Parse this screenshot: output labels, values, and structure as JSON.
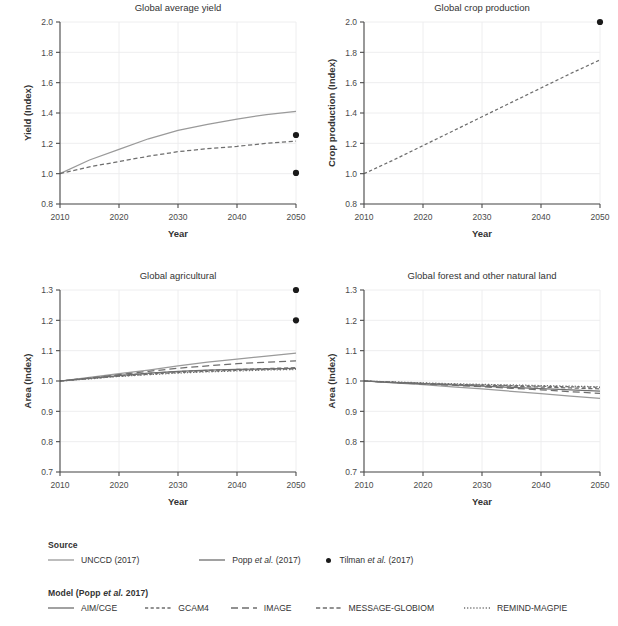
{
  "figure": {
    "width": 618,
    "height": 626,
    "background": "#ffffff",
    "text_color": "#333333"
  },
  "colors": {
    "unccd": "#9a9a9a",
    "popp": "#6e6e6e",
    "tilman": "#1a1a1a",
    "grid": "#ececed",
    "axis": "#4b4b4b"
  },
  "chart_data": [
    {
      "type": "line",
      "id": "global-average-yield",
      "title": "Global average yield",
      "xlabel": "Year",
      "ylabel": "Yield (Index)",
      "xlim": [
        2010,
        2050
      ],
      "ylim": [
        0.8,
        2.0
      ],
      "xticks": [
        2010,
        2020,
        2030,
        2040,
        2050
      ],
      "yticks": [
        0.8,
        1.0,
        1.2,
        1.4,
        1.6,
        1.8,
        2.0
      ],
      "ytick_labels": [
        "0.8",
        "1.0",
        "1.2",
        "1.4",
        "1.6",
        "1.8",
        "2.0"
      ],
      "grid": true,
      "x": [
        2010,
        2015,
        2020,
        2025,
        2030,
        2035,
        2040,
        2045,
        2050
      ],
      "series": [
        {
          "name": "UNCCD (2017)",
          "source": "unccd",
          "style": "solid",
          "values": [
            1.0,
            1.09,
            1.16,
            1.23,
            1.285,
            1.325,
            1.36,
            1.39,
            1.41
          ]
        },
        {
          "name": "Popp et al. (2017)",
          "source": "popp",
          "style": "dashed",
          "values": [
            1.0,
            1.045,
            1.08,
            1.115,
            1.145,
            1.165,
            1.18,
            1.2,
            1.215
          ]
        }
      ],
      "points": [
        {
          "name": "Tilman et al. (2017)",
          "x": 2050,
          "y": 1.255
        },
        {
          "name": "Tilman et al. (2017)",
          "x": 2050,
          "y": 1.005
        }
      ]
    },
    {
      "type": "line",
      "id": "global-crop-production",
      "title": "Global crop production",
      "xlabel": "Year",
      "ylabel": "Crop production (Index)",
      "xlim": [
        2010,
        2050
      ],
      "ylim": [
        0.8,
        2.0
      ],
      "xticks": [
        2010,
        2020,
        2030,
        2040,
        2050
      ],
      "yticks": [
        0.8,
        1.0,
        1.2,
        1.4,
        1.6,
        1.8,
        2.0
      ],
      "ytick_labels": [
        "0.8",
        "1.0",
        "1.2",
        "1.4",
        "1.6",
        "1.8",
        "2.0"
      ],
      "grid": true,
      "x": [
        2010,
        2015,
        2020,
        2025,
        2030,
        2035,
        2040,
        2045,
        2050
      ],
      "series": [
        {
          "name": "Popp et al. (2017)",
          "source": "popp",
          "style": "dotted",
          "values": [
            1.0,
            1.09,
            1.185,
            1.28,
            1.375,
            1.47,
            1.565,
            1.66,
            1.75
          ]
        }
      ],
      "points": [
        {
          "name": "Tilman et al. (2017)",
          "x": 2050,
          "y": 2.0
        }
      ]
    },
    {
      "type": "line",
      "id": "global-agricultural",
      "title": "Global agricultural",
      "xlabel": "Year",
      "ylabel": "Area (Index)",
      "xlim": [
        2010,
        2050
      ],
      "ylim": [
        0.7,
        1.3
      ],
      "xticks": [
        2010,
        2020,
        2030,
        2040,
        2050
      ],
      "yticks": [
        0.7,
        0.8,
        0.9,
        1.0,
        1.1,
        1.2,
        1.3
      ],
      "ytick_labels": [
        "0.7",
        "0.8",
        "0.9",
        "1.0",
        "1.1",
        "1.2",
        "1.3"
      ],
      "grid": true,
      "x": [
        2010,
        2015,
        2020,
        2025,
        2030,
        2035,
        2040,
        2045,
        2050
      ],
      "series": [
        {
          "name": "UNCCD (2017)",
          "source": "unccd",
          "style": "solid",
          "values": [
            1.0,
            1.012,
            1.024,
            1.036,
            1.05,
            1.062,
            1.072,
            1.082,
            1.092
          ]
        },
        {
          "name": "AIM/CGE",
          "source": "popp",
          "style": "solid",
          "values": [
            1.0,
            1.009,
            1.018,
            1.026,
            1.032,
            1.036,
            1.038,
            1.04,
            1.042
          ]
        },
        {
          "name": "GCAM4",
          "source": "popp",
          "style": "dotted",
          "values": [
            1.0,
            1.008,
            1.016,
            1.022,
            1.028,
            1.032,
            1.035,
            1.038,
            1.04
          ]
        },
        {
          "name": "IMAGE",
          "source": "popp",
          "style": "longdash",
          "values": [
            1.0,
            1.01,
            1.021,
            1.032,
            1.042,
            1.05,
            1.057,
            1.062,
            1.066
          ]
        },
        {
          "name": "MESSAGE-GLOBIOM",
          "source": "popp",
          "style": "dashed",
          "values": [
            1.0,
            1.009,
            1.018,
            1.025,
            1.031,
            1.035,
            1.038,
            1.041,
            1.044
          ]
        },
        {
          "name": "REMIND-MAGPIE",
          "source": "popp",
          "style": "finedot",
          "values": [
            1.0,
            1.007,
            1.015,
            1.021,
            1.026,
            1.03,
            1.033,
            1.036,
            1.038
          ]
        }
      ],
      "points": [
        {
          "name": "Tilman et al. (2017)",
          "x": 2050,
          "y": 1.3
        },
        {
          "name": "Tilman et al. (2017)",
          "x": 2050,
          "y": 1.2
        }
      ]
    },
    {
      "type": "line",
      "id": "global-forest-and-other-natural-land",
      "title": "Global forest and other natural land",
      "xlabel": "Year",
      "ylabel": "Area (Index)",
      "xlim": [
        2010,
        2050
      ],
      "ylim": [
        0.7,
        1.3
      ],
      "xticks": [
        2010,
        2020,
        2030,
        2040,
        2050
      ],
      "yticks": [
        0.7,
        0.8,
        0.9,
        1.0,
        1.1,
        1.2,
        1.3
      ],
      "ytick_labels": [
        "0.7",
        "0.8",
        "0.9",
        "1.0",
        "1.1",
        "1.2",
        "1.3"
      ],
      "grid": true,
      "x": [
        2010,
        2015,
        2020,
        2025,
        2030,
        2035,
        2040,
        2045,
        2050
      ],
      "series": [
        {
          "name": "UNCCD (2017)",
          "source": "unccd",
          "style": "solid",
          "values": [
            1.0,
            0.994,
            0.988,
            0.981,
            0.974,
            0.966,
            0.958,
            0.95,
            0.943
          ]
        },
        {
          "name": "AIM/CGE",
          "source": "popp",
          "style": "solid",
          "values": [
            1.0,
            0.995,
            0.991,
            0.987,
            0.983,
            0.979,
            0.975,
            0.971,
            0.967
          ]
        },
        {
          "name": "GCAM4",
          "source": "popp",
          "style": "dotted",
          "values": [
            1.0,
            0.996,
            0.992,
            0.989,
            0.987,
            0.985,
            0.983,
            0.981,
            0.979
          ]
        },
        {
          "name": "IMAGE",
          "source": "popp",
          "style": "longdash",
          "values": [
            1.0,
            0.995,
            0.99,
            0.986,
            0.981,
            0.976,
            0.971,
            0.965,
            0.959
          ]
        },
        {
          "name": "MESSAGE-GLOBIOM",
          "source": "popp",
          "style": "dashed",
          "values": [
            1.0,
            0.996,
            0.992,
            0.989,
            0.986,
            0.983,
            0.98,
            0.977,
            0.974
          ]
        },
        {
          "name": "REMIND-MAGPIE",
          "source": "popp",
          "style": "finedot",
          "values": [
            1.0,
            0.997,
            0.994,
            0.991,
            0.989,
            0.987,
            0.985,
            0.983,
            0.981
          ]
        }
      ],
      "points": []
    }
  ],
  "legend": {
    "source": {
      "heading": "Source",
      "items": [
        {
          "label": "UNCCD (2017)",
          "marker": "line",
          "style": "solid",
          "color": "#9a9a9a",
          "icon": "solid-line-icon"
        },
        {
          "label": "Popp et al. (2017)",
          "marker": "line",
          "style": "solid",
          "color": "#6e6e6e",
          "icon": "solid-line-icon"
        },
        {
          "label": "Tilman et al. (2017)",
          "marker": "dot",
          "style": "dot",
          "color": "#1a1a1a",
          "icon": "filled-circle-icon"
        }
      ]
    },
    "model": {
      "heading": "Model (Popp et al. 2017)",
      "items": [
        {
          "label": "AIM/CGE",
          "marker": "line",
          "style": "solid",
          "color": "#6e6e6e",
          "icon": "solid-line-icon"
        },
        {
          "label": "GCAM4",
          "marker": "line",
          "style": "dotted",
          "color": "#6e6e6e",
          "icon": "dotted-line-icon"
        },
        {
          "label": "IMAGE",
          "marker": "line",
          "style": "longdash",
          "color": "#6e6e6e",
          "icon": "long-dashed-line-icon"
        },
        {
          "label": "MESSAGE-GLOBIOM",
          "marker": "line",
          "style": "dashed",
          "color": "#6e6e6e",
          "icon": "dashed-line-icon"
        },
        {
          "label": "REMIND-MAGPIE",
          "marker": "line",
          "style": "finedot",
          "color": "#6e6e6e",
          "icon": "fine-dotted-line-icon"
        }
      ]
    }
  },
  "layout": {
    "panels": [
      {
        "left": 14,
        "top": 0,
        "width": 300,
        "height": 262
      },
      {
        "left": 318,
        "top": 0,
        "width": 300,
        "height": 262
      },
      {
        "left": 14,
        "top": 268,
        "width": 300,
        "height": 262
      },
      {
        "left": 318,
        "top": 268,
        "width": 300,
        "height": 262
      }
    ],
    "plot_margin": {
      "left": 46,
      "right": 18,
      "top": 22,
      "bottom": 58
    },
    "legend_source": {
      "left": 48,
      "top": 540
    },
    "legend_model": {
      "left": 48,
      "top": 588
    }
  }
}
